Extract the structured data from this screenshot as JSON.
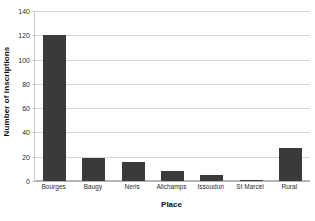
{
  "chart_data": {
    "type": "bar",
    "title": "",
    "xlabel": "Place",
    "ylabel": "Number of Inscriptions",
    "categories": [
      "Bourges",
      "Baugy",
      "Neris",
      "Alichamps",
      "Issoudun",
      "St Marcel",
      "Rural"
    ],
    "values": [
      120,
      19,
      16,
      8,
      5,
      1,
      27
    ],
    "ylim": [
      0,
      140
    ],
    "yticks": [
      0,
      20,
      40,
      60,
      80,
      100,
      120,
      140
    ],
    "ytick_labels": [
      "0",
      "20",
      "40",
      "60",
      "80",
      "100",
      "120",
      "140"
    ],
    "grid": true,
    "legend": false,
    "bar_color": "#3a3a3a",
    "gridline_color": "#d6d6d6",
    "background_color": "#ffffff"
  }
}
